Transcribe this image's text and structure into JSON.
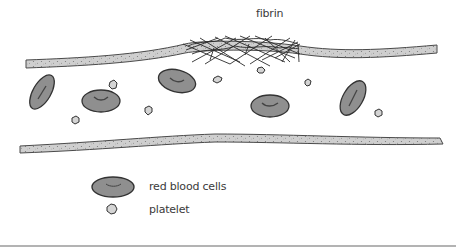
{
  "diagram": {
    "labels": {
      "fibrin": "fibrin"
    },
    "legend": {
      "items": [
        {
          "icon": "red-blood-cell-icon",
          "label": "red blood cells"
        },
        {
          "icon": "platelet-icon",
          "label": "platelet"
        }
      ]
    },
    "colors": {
      "vessel_wall": "#c9c9c9",
      "vessel_outline": "#4a4a4a",
      "cell_fill": "#8f8f8f",
      "cell_outline": "#333333",
      "platelet_fill": "#d4d4d4",
      "fibrin_strand": "#2a2a2a",
      "background": "#ffffff",
      "divider": "#9a9a9a"
    }
  }
}
